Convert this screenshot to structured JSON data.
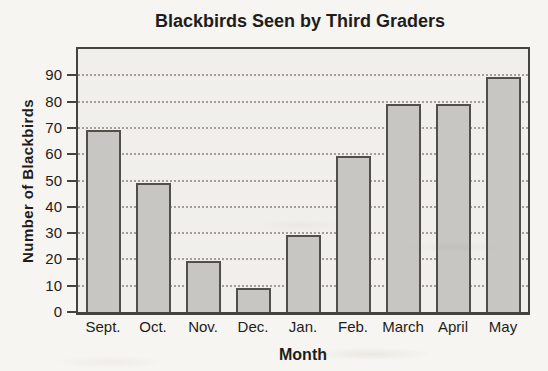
{
  "chart_data": {
    "type": "bar",
    "title": "Blackbirds Seen by Third Graders",
    "xlabel": "Month",
    "ylabel": "Number of Blackbirds",
    "categories": [
      "Sept.",
      "Oct.",
      "Nov.",
      "Dec.",
      "Jan.",
      "Feb.",
      "March",
      "April",
      "May"
    ],
    "values": [
      70,
      50,
      20,
      10,
      30,
      60,
      80,
      80,
      90
    ],
    "ylim": [
      0,
      100
    ],
    "yticks": [
      0,
      10,
      20,
      30,
      40,
      50,
      60,
      70,
      80,
      90
    ],
    "grid": "horizontal dotted",
    "legend": "none",
    "colors": {
      "page_bg": "#f7f5f1",
      "plot_bg": "#f1efeb",
      "bar_fill": "#c7c6c2",
      "bar_border": "#514f4a",
      "frame": "#45433e",
      "grid": "#979188",
      "text": "#1e1d1b"
    }
  }
}
